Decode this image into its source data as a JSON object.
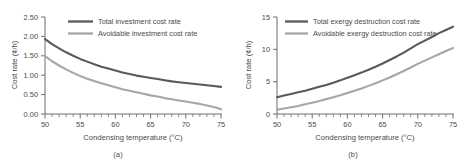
{
  "figure": {
    "panels": [
      {
        "id": "a",
        "caption": "(a)",
        "chart_data": {
          "type": "line",
          "title": "",
          "xlabel": "Condensing temperature (°C)",
          "ylabel": "Cost rate (¢/h)",
          "xlim": [
            50,
            75
          ],
          "ylim": [
            0.0,
            2.5
          ],
          "xticks": [
            50,
            55,
            60,
            65,
            70,
            75
          ],
          "xtick_labels": [
            "50",
            "55",
            "60",
            "65",
            "70",
            "75"
          ],
          "yticks": [
            0.0,
            0.5,
            1.0,
            1.5,
            2.0,
            2.5
          ],
          "ytick_labels": [
            "0.00",
            "0.50",
            "1.00",
            "1.50",
            "2.00",
            "2.50"
          ],
          "grid": false,
          "minor_ticks_x": 1,
          "legend_position": "top-right",
          "x": [
            50,
            51,
            52,
            53,
            54,
            55,
            56,
            57,
            58,
            59,
            60,
            61,
            62,
            63,
            64,
            65,
            66,
            67,
            68,
            69,
            70,
            71,
            72,
            73,
            74,
            75
          ],
          "series": [
            {
              "name": "Total investment cost rate",
              "color": "#595959",
              "values": [
                1.93,
                1.8,
                1.69,
                1.59,
                1.5,
                1.42,
                1.35,
                1.28,
                1.22,
                1.17,
                1.12,
                1.07,
                1.03,
                0.99,
                0.96,
                0.93,
                0.9,
                0.87,
                0.84,
                0.82,
                0.8,
                0.78,
                0.76,
                0.74,
                0.72,
                0.7
              ]
            },
            {
              "name": "Avoidable investment cost rate",
              "color": "#a6a6a6",
              "values": [
                1.49,
                1.36,
                1.25,
                1.15,
                1.06,
                0.98,
                0.91,
                0.85,
                0.79,
                0.74,
                0.69,
                0.64,
                0.6,
                0.56,
                0.52,
                0.48,
                0.45,
                0.41,
                0.38,
                0.35,
                0.32,
                0.29,
                0.26,
                0.22,
                0.18,
                0.12
              ]
            }
          ]
        }
      },
      {
        "id": "b",
        "caption": "(b)",
        "chart_data": {
          "type": "line",
          "title": "",
          "xlabel": "Condensing temperature (°C)",
          "ylabel": "Cost rate (¢/h)",
          "xlim": [
            50,
            75
          ],
          "ylim": [
            0,
            15
          ],
          "xticks": [
            50,
            55,
            60,
            65,
            70,
            75
          ],
          "xtick_labels": [
            "50",
            "55",
            "60",
            "65",
            "70",
            "75"
          ],
          "yticks": [
            0,
            5,
            10,
            15
          ],
          "ytick_labels": [
            "0",
            "5",
            "10",
            "15"
          ],
          "grid": false,
          "minor_ticks_x": 1,
          "legend_position": "top-right",
          "x": [
            50,
            51,
            52,
            53,
            54,
            55,
            56,
            57,
            58,
            59,
            60,
            61,
            62,
            63,
            64,
            65,
            66,
            67,
            68,
            69,
            70,
            71,
            72,
            73,
            74,
            75
          ],
          "series": [
            {
              "name": "Total exergy destruction cost rate",
              "color": "#595959",
              "values": [
                2.6,
                2.85,
                3.1,
                3.35,
                3.6,
                3.9,
                4.2,
                4.5,
                4.85,
                5.2,
                5.6,
                6.0,
                6.4,
                6.85,
                7.3,
                7.8,
                8.35,
                8.9,
                9.5,
                10.15,
                10.8,
                11.35,
                11.9,
                12.5,
                13.0,
                13.5
              ]
            },
            {
              "name": "Avoidable exergy destruction cost rate",
              "color": "#a6a6a6",
              "values": [
                0.65,
                0.85,
                1.05,
                1.25,
                1.5,
                1.75,
                2.0,
                2.3,
                2.6,
                2.9,
                3.25,
                3.6,
                3.95,
                4.35,
                4.75,
                5.2,
                5.65,
                6.15,
                6.65,
                7.2,
                7.75,
                8.25,
                8.75,
                9.25,
                9.75,
                10.2
              ]
            }
          ]
        }
      }
    ]
  }
}
